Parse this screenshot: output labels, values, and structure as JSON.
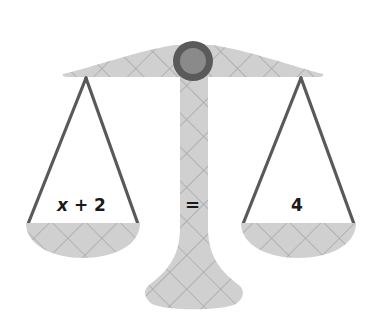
{
  "diagram": {
    "type": "balance-scale",
    "left_pan": {
      "variable": "x",
      "operator": "+",
      "constant": "2",
      "expression": "x + 2"
    },
    "center": {
      "relation": "="
    },
    "right_pan": {
      "expression": "4"
    },
    "equation": "x + 2 = 4",
    "colors": {
      "fill": "#d0d0d0",
      "hatch": "#a6a6a6",
      "rope": "#595959",
      "pivot_outer": "#5a5a5a",
      "pivot_inner": "#8a8a8a",
      "text": "#1a1a1a"
    }
  }
}
